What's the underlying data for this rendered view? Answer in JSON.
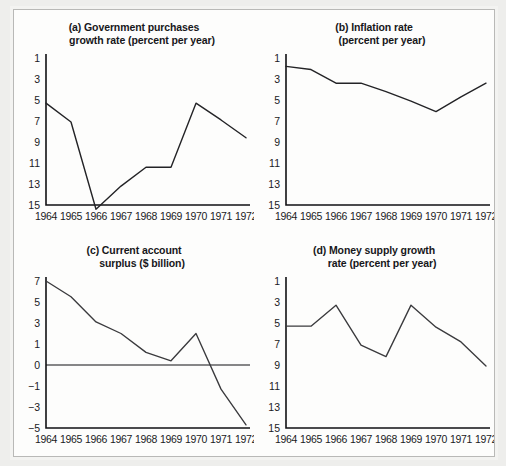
{
  "figure": {
    "panel_count": 4,
    "background_color": "#eeeeec",
    "panel_color": "#fdfdfc",
    "border_color": "#b9b9b7",
    "line_color": "#3a3a3d"
  },
  "panels": {
    "a": {
      "label": "(a)",
      "title_line1": "(a) Government purchases",
      "title_line2": "growth rate (percent per year)"
    },
    "b": {
      "label": "(b)",
      "title_line1": "(b) Inflation rate",
      "title_line2": "(percent per year)"
    },
    "c": {
      "label": "(c)",
      "title_line1": "(c) Current account",
      "title_line2": "surplus ($ billion)"
    },
    "d": {
      "label": "(d)",
      "title_line1": "(d) Money supply growth",
      "title_line2": "rate (percent per year)"
    }
  },
  "chart_data": [
    {
      "type": "line",
      "panel": "a",
      "title": "(a) Government purchases growth rate (percent per year)",
      "xlabel": "",
      "ylabel": "percent per year",
      "x": [
        "1964",
        "1965",
        "1966",
        "1967",
        "1968",
        "1969",
        "1970",
        "1971",
        "1972"
      ],
      "values": [
        5.3,
        7.1,
        15.4,
        13.2,
        11.4,
        11.4,
        5.3,
        6.9,
        8.6
      ],
      "yticks": [
        1,
        3,
        5,
        7,
        9,
        11,
        13,
        15
      ],
      "ylim": [
        1,
        15.8
      ],
      "grid": false,
      "legend": "none"
    },
    {
      "type": "line",
      "panel": "b",
      "title": "(b) Inflation rate (percent per year)",
      "xlabel": "",
      "ylabel": "percent per year",
      "x": [
        "1964",
        "1965",
        "1966",
        "1967",
        "1968",
        "1969",
        "1970",
        "1971",
        "1972"
      ],
      "values": [
        1.8,
        2.1,
        3.4,
        3.4,
        4.2,
        5.1,
        6.1,
        4.7,
        3.4
      ],
      "yticks": [
        1,
        3,
        5,
        7,
        9,
        11,
        13,
        15
      ],
      "ylim": [
        1,
        15.8
      ],
      "grid": false,
      "legend": "none"
    },
    {
      "type": "line",
      "panel": "c",
      "title": "(c) Current account surplus ($ billion)",
      "xlabel": "",
      "ylabel": "$ billion",
      "x": [
        "1964",
        "1965",
        "1966",
        "1967",
        "1968",
        "1969",
        "1970",
        "1971",
        "1972"
      ],
      "values": [
        7.0,
        5.5,
        3.1,
        2.0,
        0.6,
        0.2,
        2.0,
        -1.3,
        -4.7
      ],
      "yticks": [
        7,
        5,
        3,
        1,
        0,
        -1,
        -3,
        -5
      ],
      "ylim": [
        -5,
        7
      ],
      "zero_line": 0,
      "grid": false,
      "legend": "none"
    },
    {
      "type": "line",
      "panel": "d",
      "title": "(d) Money supply growth rate (percent per year)",
      "xlabel": "",
      "ylabel": "percent per year",
      "x": [
        "1964",
        "1965",
        "1966",
        "1967",
        "1968",
        "1969",
        "1970",
        "1971",
        "1972"
      ],
      "values": [
        5.3,
        5.3,
        3.3,
        7.1,
        8.2,
        3.3,
        5.4,
        6.8,
        9.1
      ],
      "yticks": [
        1,
        3,
        5,
        7,
        9,
        11,
        13,
        15
      ],
      "ylim": [
        1,
        15.8
      ],
      "grid": false,
      "legend": "none"
    }
  ]
}
